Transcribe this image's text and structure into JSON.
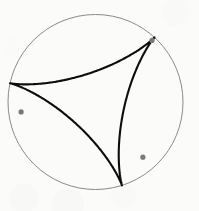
{
  "figure": {
    "name": "deltoid-in-circle",
    "caption": "",
    "background_color": "#fbfbfa"
  },
  "chart_data": {
    "type": "line",
    "title": "",
    "subtitle": "",
    "xlabel": "",
    "ylabel": "",
    "grid": false,
    "legend_position": "none",
    "axis_visible": false,
    "tick_labels": [],
    "annotations": [],
    "xlim": [
      0,
      199
    ],
    "ylim": [
      0,
      211
    ],
    "series": [
      {
        "name": "circumscribed-circle",
        "kind": "circle",
        "stroke_color": "#8a8a8a",
        "stroke_width": 1,
        "fill": "none",
        "center": [
          95.5,
          102.0
        ],
        "radius": 87.5
      },
      {
        "name": "deltoid-curve",
        "kind": "hypocycloid",
        "cusps": 3,
        "stroke_color": "#0d0d0d",
        "stroke_width": 2.1,
        "fill": "none",
        "center": [
          95.5,
          102.0
        ],
        "radius": 87.5,
        "rolling_radius": 29.1667,
        "phase_degrees": -47.6,
        "points": [
          [
            152.0,
            40.4
          ],
          [
            146.0,
            45.6
          ],
          [
            139.5,
            51.7
          ],
          [
            132.6,
            58.6
          ],
          [
            125.3,
            66.2
          ],
          [
            117.6,
            74.3
          ],
          [
            109.7,
            82.7
          ],
          [
            101.5,
            91.2
          ],
          [
            93.1,
            99.4
          ],
          [
            84.5,
            106.8
          ],
          [
            75.8,
            112.8
          ],
          [
            66.9,
            116.6
          ],
          [
            57.8,
            117.6
          ],
          [
            48.5,
            115.7
          ],
          [
            38.9,
            111.3
          ],
          [
            29.9,
            106.5
          ],
          [
            21.1,
            111.9
          ],
          [
            29.5,
            117.7
          ],
          [
            39.1,
            122.5
          ],
          [
            48.7,
            126.9
          ],
          [
            58.0,
            131.5
          ],
          [
            66.9,
            136.4
          ],
          [
            75.5,
            141.7
          ],
          [
            83.7,
            147.3
          ],
          [
            91.4,
            153.0
          ],
          [
            98.7,
            158.6
          ],
          [
            105.6,
            163.7
          ],
          [
            112.2,
            167.8
          ],
          [
            118.4,
            170.3
          ],
          [
            124.5,
            170.6
          ],
          [
            130.4,
            168.0
          ],
          [
            136.3,
            162.1
          ],
          [
            142.9,
            157.2
          ],
          [
            142.2,
            147.3
          ],
          [
            141.0,
            137.1
          ],
          [
            139.9,
            126.9
          ],
          [
            139.2,
            116.9
          ],
          [
            138.9,
            107.3
          ],
          [
            139.2,
            98.1
          ],
          [
            140.2,
            89.3
          ],
          [
            141.8,
            81.1
          ],
          [
            144.0,
            73.3
          ],
          [
            146.7,
            65.9
          ],
          [
            149.6,
            58.7
          ],
          [
            152.0,
            40.4
          ]
        ]
      }
    ],
    "markers": [
      {
        "name": "cusp-top-right",
        "position": [
          152.0,
          40.4
        ],
        "radius": 2.6,
        "color": "#7a7a7a"
      },
      {
        "name": "cusp-left",
        "position": [
          21.1,
          111.9
        ],
        "radius": 2.6,
        "color": "#7a7a7a"
      },
      {
        "name": "cusp-bottom",
        "position": [
          142.9,
          157.2
        ],
        "radius": 2.6,
        "color": "#7a7a7a"
      }
    ]
  }
}
